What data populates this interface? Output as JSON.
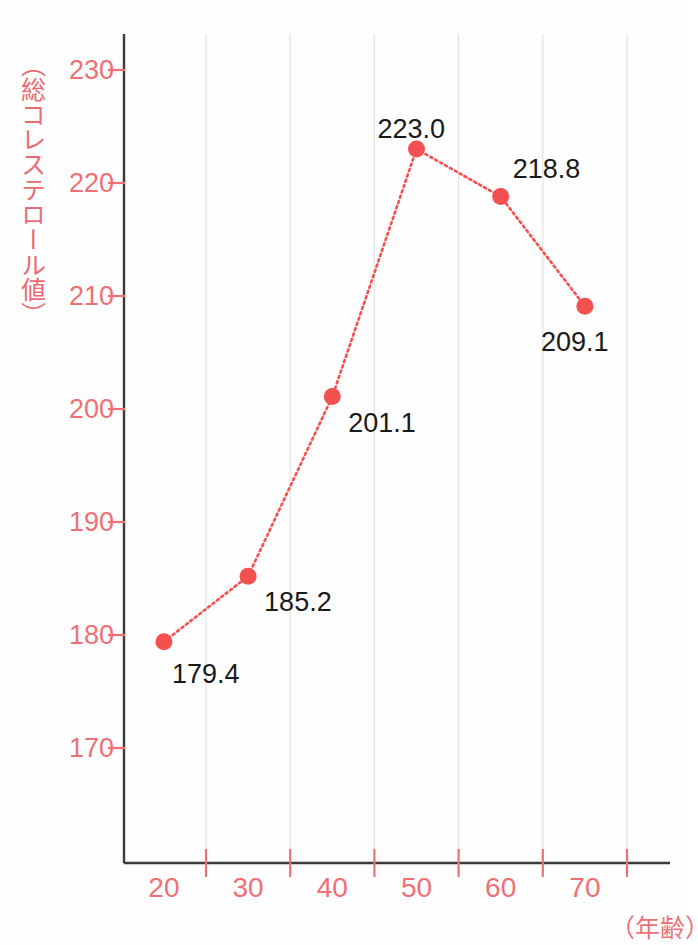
{
  "chart_data": {
    "type": "line",
    "title": "",
    "subtitle": "",
    "xlabel": "（年齢）",
    "ylabel": "（総コレステロール値）",
    "x": [
      20,
      30,
      40,
      50,
      60,
      70
    ],
    "categories": [
      "20",
      "30",
      "40",
      "50",
      "60",
      "70"
    ],
    "values": [
      179.4,
      185.2,
      201.1,
      223.0,
      218.8,
      209.1
    ],
    "point_labels": [
      "179.4",
      "185.2",
      "201.1",
      "223.0",
      "218.8",
      "209.1"
    ],
    "series": [
      {
        "name": "総コレステロール値",
        "values": [
          179.4,
          185.2,
          201.1,
          223.0,
          218.8,
          209.1
        ]
      }
    ],
    "ylim": [
      165,
      234
    ],
    "xlim": [
      15,
      80
    ],
    "y_ticks": [
      170,
      180,
      190,
      200,
      210,
      220,
      230
    ],
    "y_tick_labels": [
      "170",
      "180",
      "190",
      "200",
      "210",
      "220",
      "230"
    ],
    "x_ticks": [
      25,
      35,
      45,
      55,
      65,
      75
    ],
    "x_tick_labels": [
      "20",
      "30",
      "40",
      "50",
      "60",
      "70"
    ],
    "grid": "vertical",
    "legend": "none",
    "marker": "circle",
    "line_style": "dotted",
    "colors": {
      "series": "#f4504f",
      "marker": "#f4504f",
      "axis": "#3b3b3b",
      "axis_tick_label": "#ee7077",
      "axis_title": "#ea6a73",
      "value_label": "#1a1a1a",
      "gridline": "#e4e4e6",
      "background": "#fefefe"
    }
  }
}
